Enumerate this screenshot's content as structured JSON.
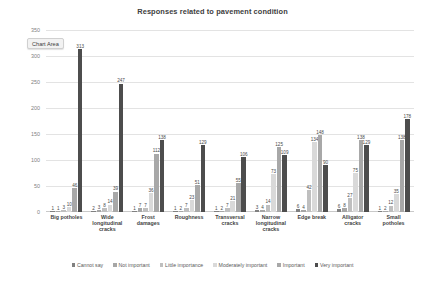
{
  "chart_data": {
    "type": "bar",
    "title": "Responses related to pavement condition",
    "xlabel": "",
    "ylabel": "Number of responses",
    "ylim": [
      0,
      350
    ],
    "yticks": [
      0,
      50,
      100,
      150,
      200,
      250,
      300,
      350
    ],
    "grid": true,
    "legend_position": "bottom",
    "categories": [
      "Big potholes",
      "Wide\nlongitudinal\ncracks",
      "Frost\ndamages",
      "Roughness",
      "Transversal\ncracks",
      "Narrow\nlongitudinal\ncracks",
      "Edge break",
      "Alligator\ncracks",
      "Small\npotholes"
    ],
    "series": [
      {
        "name": "Cannot say",
        "color": "#808080",
        "values": [
          1,
          2,
          1,
          1,
          1,
          3,
          6,
          6,
          1
        ]
      },
      {
        "name": "Not important",
        "color": "#a6a6a6",
        "values": [
          1,
          3,
          7,
          2,
          2,
          4,
          4,
          8,
          2
        ]
      },
      {
        "name": "Little importance",
        "color": "#bfbfbf",
        "values": [
          3,
          8,
          7,
          7,
          7,
          14,
          42,
          27,
          12
        ]
      },
      {
        "name": "Moderately important",
        "color": "#d9d9d9",
        "values": [
          10,
          14,
          36,
          23,
          21,
          73,
          134,
          75,
          35
        ]
      },
      {
        "name": "Important",
        "color": "#a8a8a8",
        "values": [
          46,
          39,
          112,
          51,
          55,
          125,
          148,
          138,
          138
        ]
      },
      {
        "name": "Very important",
        "color": "#4d4d4d",
        "values": [
          313,
          247,
          138,
          129,
          106,
          109,
          90,
          129,
          178
        ]
      }
    ],
    "bar_labels": {
      "Big potholes": [
        "1",
        "1",
        "3",
        "10",
        "46",
        "313"
      ],
      "Wide longitudinal cracks": [
        "2",
        "3",
        "8",
        "14",
        "39",
        "247"
      ],
      "Frost damages": [
        "1",
        "7",
        "7",
        "36",
        "112",
        "138"
      ],
      "Roughness": [
        "1",
        "2",
        "7",
        "23",
        "51",
        "129"
      ],
      "Transversal cracks": [
        "1",
        "2",
        "7",
        "21",
        "55",
        "106"
      ],
      "Narrow longitudinal cracks": [
        "3",
        "4",
        "14",
        "73",
        "125",
        "109"
      ],
      "Edge break": [
        "6",
        "4",
        "42",
        "134",
        "148",
        "90"
      ],
      "Alligator cracks": [
        "6",
        "8",
        "27",
        "75",
        "138",
        "129"
      ],
      "Small potholes": [
        "1",
        "2",
        "12",
        "35",
        "138",
        "178"
      ]
    }
  },
  "tooltip": {
    "label": "Chart Area"
  },
  "legend": {
    "items": [
      "Cannot say",
      "Not important",
      "Little importance",
      "Moderately important",
      "Important",
      "Very important"
    ]
  }
}
